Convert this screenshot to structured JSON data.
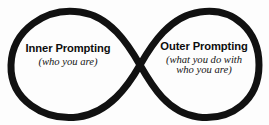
{
  "diagram": {
    "type": "infinity-loop-diagram",
    "shape_name": "lemniscate",
    "background_color": "#fdfdfd",
    "stroke_color": "#111111",
    "stroke_width": 7,
    "crossing_point": {
      "x": 140,
      "y": 65
    },
    "left_lobe": {
      "apex_x": 65,
      "left_edge_x": 10,
      "top_y": 11,
      "bottom_y": 118
    },
    "right_lobe": {
      "apex_x": 200,
      "right_edge_x": 260,
      "top_y": 11,
      "bottom_y": 118
    }
  },
  "labels": {
    "inner": {
      "title": "Inner Prompting",
      "subtitle_line1": "(who you are)",
      "subtitle_line2": ""
    },
    "outer": {
      "title": "Outer Prompting",
      "subtitle_line1": "(what you do with",
      "subtitle_line2": "who you are)"
    }
  }
}
